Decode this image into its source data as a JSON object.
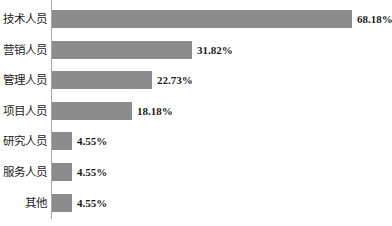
{
  "chart_data": {
    "type": "bar",
    "orientation": "horizontal",
    "title": "",
    "subtitle": "",
    "xlabel": "",
    "ylabel": "",
    "grid": false,
    "legend": false,
    "legend_position": "none",
    "axis_line": true,
    "xlim": [
      0,
      100
    ],
    "value_suffix": "%",
    "categories": [
      "技术人员",
      "营销人员",
      "管理人员",
      "项目人员",
      "研究人员",
      "服务人员",
      "其他"
    ],
    "values": [
      68.18,
      31.82,
      22.73,
      18.18,
      4.55,
      4.55,
      4.55
    ],
    "value_labels": [
      "68.18%",
      "31.82%",
      "22.73%",
      "18.18%",
      "4.55%",
      "4.55%",
      "4.55%"
    ],
    "colors": {
      "bar": "#8c8c8c",
      "axis": "#a8a8a8",
      "text": "#1a1a1a",
      "background": "#ffffff"
    }
  }
}
